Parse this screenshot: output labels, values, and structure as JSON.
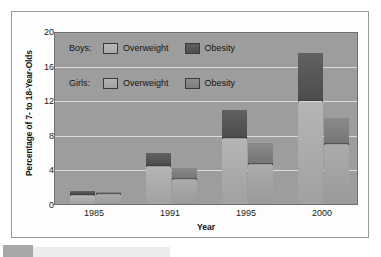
{
  "chart_data": {
    "type": "bar",
    "title": "",
    "subtitle": "",
    "xlabel": "Year",
    "ylabel": "Percentage of 7- to 18-Year-Olds",
    "categories": [
      "1985",
      "1991",
      "1995",
      "2000"
    ],
    "ylim": [
      0,
      20
    ],
    "yticks": [
      0,
      4,
      8,
      12,
      16,
      20
    ],
    "grid": true,
    "stacked": true,
    "legend_position": "inside-top-left",
    "series": [
      {
        "name": "Boys: Overweight",
        "group": "Boys",
        "measure": "Overweight",
        "color": "#ababab",
        "values": [
          0.9,
          4.3,
          7.5,
          11.8
        ]
      },
      {
        "name": "Boys: Obesity",
        "group": "Boys",
        "measure": "Obesity",
        "color": "#535353",
        "values": [
          0.5,
          1.5,
          3.2,
          5.5
        ]
      },
      {
        "name": "Girls: Overweight",
        "group": "Girls",
        "measure": "Overweight",
        "color": "#9e9e9e",
        "values": [
          1.0,
          2.8,
          4.5,
          6.8
        ]
      },
      {
        "name": "Girls: Obesity",
        "group": "Girls",
        "measure": "Obesity",
        "color": "#808080",
        "values": [
          0.3,
          1.3,
          2.4,
          3.0
        ]
      }
    ],
    "totals": {
      "boys": [
        1.4,
        5.8,
        10.7,
        17.3
      ],
      "girls": [
        1.3,
        4.1,
        6.9,
        9.8
      ]
    },
    "annotations": []
  },
  "legend": {
    "rows": [
      {
        "group_label": "Boys:",
        "entries": [
          {
            "label": "Overweight",
            "swatch": "boys-overweight-swatch"
          },
          {
            "label": "Obesity",
            "swatch": "boys-obesity-swatch"
          }
        ]
      },
      {
        "group_label": "Girls:",
        "entries": [
          {
            "label": "Overweight",
            "swatch": "girls-overweight-swatch"
          },
          {
            "label": "Obesity",
            "swatch": "girls-obesity-swatch"
          }
        ]
      }
    ]
  },
  "colors": {
    "plot_background": "#9d9d9d",
    "gridline": "#e8e8e8",
    "frame": "#9a9a9a",
    "boys_overweight": "#ababab",
    "boys_obesity": "#535353",
    "girls_overweight": "#9e9e9e",
    "girls_obesity": "#808080"
  }
}
